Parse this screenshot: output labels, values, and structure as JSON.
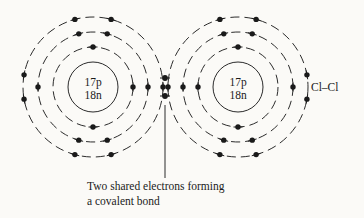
{
  "figure": {
    "type": "bohr-model-covalent-bond",
    "background_color": "#fbfaf7",
    "ink_color": "#1a1a1a"
  },
  "atoms": [
    {
      "id": "left-chlorine",
      "nucleus_line1": "17p",
      "nucleus_line2": "18n",
      "center_x": 93,
      "center_y": 87,
      "nucleus_radius": 25,
      "shell_radii": [
        40,
        55,
        70
      ],
      "shell_electron_angles_deg": {
        "shell1": [
          270,
          90,
          0
        ],
        "shell2": [
          255,
          285,
          75,
          105,
          180,
          0
        ],
        "shell3": [
          255,
          285,
          75,
          105,
          170,
          190,
          0
        ]
      }
    },
    {
      "id": "right-chlorine",
      "nucleus_line1": "17p",
      "nucleus_line2": "18n",
      "center_x": 238,
      "center_y": 87,
      "nucleus_radius": 25,
      "shell_radii": [
        40,
        55,
        70
      ],
      "shell_electron_angles_deg": {
        "shell1": [
          270,
          90,
          180
        ],
        "shell2": [
          255,
          285,
          75,
          105,
          0,
          180
        ],
        "shell3": [
          255,
          285,
          75,
          105,
          10,
          350,
          180
        ]
      }
    }
  ],
  "shared_electrons": {
    "count": 2,
    "positions": [
      {
        "x": 165,
        "y": 78
      },
      {
        "x": 165,
        "y": 96
      }
    ]
  },
  "molecule_label": {
    "text": "Cl–Cl",
    "x": 311,
    "y": 91
  },
  "caption": {
    "line1": "Two shared electrons forming",
    "line2": "a covalent bond",
    "x": 87,
    "line1_y": 190,
    "line2_y": 205
  },
  "leader": {
    "from_x": 165,
    "from_y": 105,
    "to_x": 165,
    "to_y": 178
  }
}
